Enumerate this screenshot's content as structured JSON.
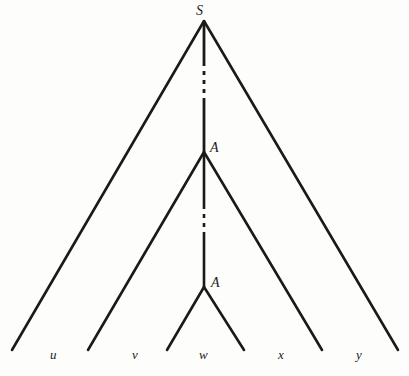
{
  "figure": {
    "kind": "parse-tree-diagram",
    "background_color": "#fdfdfc",
    "stroke_color": "#1a1a1a",
    "width": 409,
    "height": 376
  },
  "nodes": [
    {
      "id": "root",
      "label": "S",
      "x": 204,
      "y": 21,
      "label_x": 196,
      "label_y": 4
    },
    {
      "id": "inner-a1",
      "label": "A",
      "x": 204,
      "y": 152,
      "label_x": 210,
      "label_y": 141
    },
    {
      "id": "inner-a2",
      "label": "A",
      "x": 204,
      "y": 287,
      "label_x": 211,
      "label_y": 276
    }
  ],
  "leaves": [
    {
      "id": "leaf-u",
      "label": "u",
      "x": 50,
      "y": 348
    },
    {
      "id": "leaf-v",
      "label": "v",
      "x": 132,
      "y": 348
    },
    {
      "id": "leaf-w",
      "label": "w",
      "x": 199,
      "y": 348
    },
    {
      "id": "leaf-x",
      "label": "x",
      "x": 278,
      "y": 348
    },
    {
      "id": "leaf-y",
      "label": "y",
      "x": 356,
      "y": 348
    }
  ],
  "edges": [
    {
      "id": "edge-root-left",
      "kind": "solid",
      "x1": 204,
      "y1": 21,
      "x2": 12,
      "y2": 350
    },
    {
      "id": "edge-root-right",
      "kind": "solid",
      "x1": 204,
      "y1": 21,
      "x2": 398,
      "y2": 350
    },
    {
      "id": "edge-root-a1-top",
      "kind": "solid",
      "x1": 204,
      "y1": 21,
      "x2": 204,
      "y2": 62
    },
    {
      "id": "edge-root-a1-mid",
      "kind": "dashed",
      "x1": 204,
      "y1": 62,
      "x2": 204,
      "y2": 98
    },
    {
      "id": "edge-root-a1-bot",
      "kind": "solid",
      "x1": 204,
      "y1": 98,
      "x2": 204,
      "y2": 152
    },
    {
      "id": "edge-a1-left",
      "kind": "solid",
      "x1": 204,
      "y1": 152,
      "x2": 88,
      "y2": 350
    },
    {
      "id": "edge-a1-right",
      "kind": "solid",
      "x1": 204,
      "y1": 152,
      "x2": 322,
      "y2": 350
    },
    {
      "id": "edge-a1-a2-top",
      "kind": "solid",
      "x1": 204,
      "y1": 152,
      "x2": 204,
      "y2": 205
    },
    {
      "id": "edge-a1-a2-mid",
      "kind": "dashed",
      "x1": 204,
      "y1": 205,
      "x2": 204,
      "y2": 235
    },
    {
      "id": "edge-a1-a2-bot",
      "kind": "solid",
      "x1": 204,
      "y1": 235,
      "x2": 204,
      "y2": 287
    },
    {
      "id": "edge-a2-left",
      "kind": "solid",
      "x1": 204,
      "y1": 287,
      "x2": 167,
      "y2": 350
    },
    {
      "id": "edge-a2-right",
      "kind": "solid",
      "x1": 204,
      "y1": 287,
      "x2": 244,
      "y2": 350
    }
  ]
}
